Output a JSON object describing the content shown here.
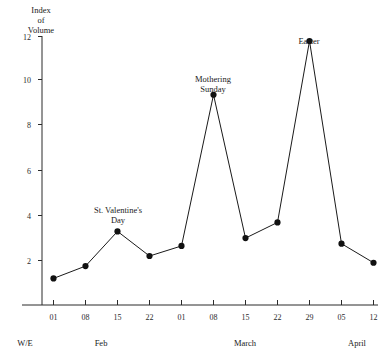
{
  "chart_data": {
    "type": "line",
    "title": "",
    "ylabel_lines": [
      "Index",
      "of",
      "Volume"
    ],
    "xlabel": "",
    "categories": [
      "01",
      "08",
      "15",
      "22",
      "01",
      "08",
      "15",
      "22",
      "29",
      "05",
      "12"
    ],
    "values": [
      1.2,
      1.75,
      3.3,
      2.2,
      2.65,
      9.4,
      3.0,
      3.7,
      11.8,
      2.75,
      1.9
    ],
    "ylim": [
      0,
      12
    ],
    "yticks": [
      2,
      4,
      6,
      8,
      10,
      12
    ],
    "ytick_labels": [
      "2",
      "4",
      "6",
      "8",
      "10",
      "12"
    ],
    "grid": false,
    "legend": "none",
    "series": [
      {
        "name": "Index of Volume",
        "values": [
          1.2,
          1.75,
          3.3,
          2.2,
          2.65,
          9.4,
          3.0,
          3.7,
          11.8,
          2.75,
          1.9
        ]
      }
    ],
    "annotations": [
      {
        "text_lines": [
          "St. Valentine's",
          "Day"
        ],
        "category_index": 2,
        "value": 3.3
      },
      {
        "text_lines": [
          "Mothering",
          "Sunday"
        ],
        "category_index": 5,
        "value": 9.4
      },
      {
        "text_lines": [
          "Easter"
        ],
        "category_index": 8,
        "value": 11.8
      }
    ],
    "month_groups": [
      {
        "label": "Feb",
        "center_index": 1.5
      },
      {
        "label": "March",
        "center_index": 6.0
      },
      {
        "label": "April",
        "center_index": 9.8
      }
    ],
    "week_ending_label": "W/E"
  },
  "axis": {
    "y_title_line1": "Index",
    "y_title_line2": "of",
    "y_title_line3": "Volume",
    "ytick_2": "2",
    "ytick_4": "4",
    "ytick_6": "6",
    "ytick_8": "8",
    "ytick_10": "10",
    "ytick_12": "12"
  },
  "xticks": {
    "t0": "01",
    "t1": "08",
    "t2": "15",
    "t3": "22",
    "t4": "01",
    "t5": "08",
    "t6": "15",
    "t7": "22",
    "t8": "29",
    "t9": "05",
    "t10": "12"
  },
  "groups": {
    "we": "W/E",
    "feb": "Feb",
    "march": "March",
    "april": "April"
  },
  "annotations": {
    "valentine_l1": "St. Valentine's",
    "valentine_l2": "Day",
    "mothering_l1": "Mothering",
    "mothering_l2": "Sunday",
    "easter_l1": "Easter"
  },
  "colors": {
    "line": "#1a1a1a",
    "point": "#111111",
    "axis": "#2b2b2b",
    "background": "#ffffff"
  }
}
